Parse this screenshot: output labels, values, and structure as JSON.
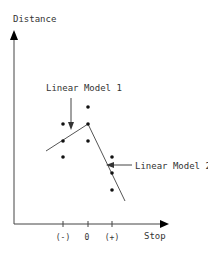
{
  "diagram": {
    "y_axis_label": "Distance",
    "x_axis_label": "Stop",
    "x_ticks": [
      "(-)",
      "0",
      "(+)"
    ],
    "annotations": {
      "model1": "Linear Model 1",
      "model2": "Linear Model 2"
    },
    "colors": {
      "stroke": "#222222",
      "background": "#ffffff"
    },
    "points": [
      {
        "x": 63,
        "y": 124
      },
      {
        "x": 63,
        "y": 141
      },
      {
        "x": 63,
        "y": 157
      },
      {
        "x": 88,
        "y": 107
      },
      {
        "x": 88,
        "y": 124
      },
      {
        "x": 88,
        "y": 141
      },
      {
        "x": 112,
        "y": 157
      },
      {
        "x": 112,
        "y": 173
      },
      {
        "x": 112,
        "y": 190
      }
    ]
  }
}
